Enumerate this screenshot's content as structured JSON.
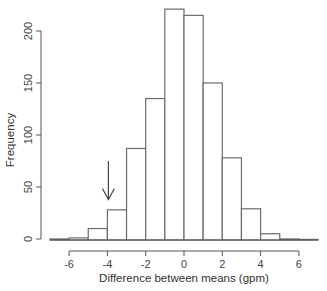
{
  "chart_data": {
    "type": "bar",
    "subtype": "histogram",
    "title": "",
    "xlabel": "Difference between means (gpm)",
    "ylabel": "Frequency",
    "bin_edges": [
      -7,
      -6,
      -5,
      -4,
      -3,
      -2,
      -1,
      0,
      1,
      2,
      3,
      4,
      5,
      6,
      7
    ],
    "categories": [
      "-7 to -6",
      "-6 to -5",
      "-5 to -4",
      "-4 to -3",
      "-3 to -2",
      "-2 to -1",
      "-1 to 0",
      "0 to 1",
      "1 to 2",
      "2 to 3",
      "3 to 4",
      "4 to 5",
      "5 to 6",
      "6 to 7"
    ],
    "values": [
      1,
      2,
      11,
      29,
      88,
      136,
      222,
      216,
      151,
      79,
      30,
      6,
      1,
      0
    ],
    "xticks": [
      -6,
      -4,
      -2,
      0,
      2,
      4,
      6
    ],
    "yticks": [
      0,
      50,
      100,
      150,
      200
    ],
    "xlim": [
      -6,
      6
    ],
    "ylim": [
      0,
      222
    ],
    "grid": false,
    "legend": null,
    "annotations": [
      {
        "type": "arrow",
        "direction": "down",
        "x": -4,
        "from_y": 75,
        "to_y": 38,
        "description": "arrow pointing to observed difference near -4"
      }
    ]
  },
  "colors": {
    "bar_fill": "#ffffff",
    "bar_edge": "#6b6b6b",
    "axis": "#555555",
    "text": "#333333"
  }
}
